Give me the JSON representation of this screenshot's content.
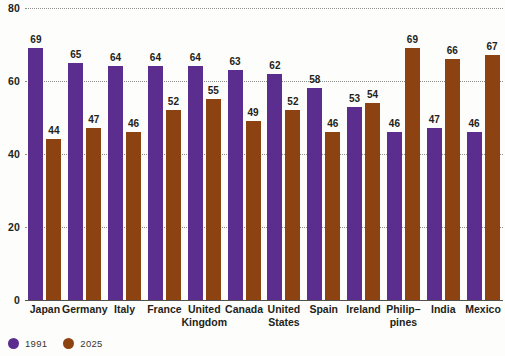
{
  "chart_data": {
    "type": "bar",
    "title": "",
    "subtitle": "",
    "xlabel": "",
    "ylabel": "",
    "ylim": [
      0,
      80
    ],
    "yticks": [
      0,
      20,
      40,
      60,
      80
    ],
    "ytick_labels": [
      "0",
      "20",
      "40",
      "60",
      "80"
    ],
    "grid": true,
    "grid_style": "dotted-horizontal",
    "legend_position": "bottom-left",
    "categories": [
      "Japan",
      "Germany",
      "Italy",
      "France",
      "United Kingdom",
      "Canada",
      "United States",
      "Spain",
      "Ireland",
      "Philip–pines",
      "India",
      "Mexico"
    ],
    "category_lines": [
      [
        "Japan",
        ""
      ],
      [
        "Germany",
        ""
      ],
      [
        "Italy",
        ""
      ],
      [
        "France",
        ""
      ],
      [
        "United",
        "Kingdom"
      ],
      [
        "Canada",
        ""
      ],
      [
        "United",
        "States"
      ],
      [
        "Spain",
        ""
      ],
      [
        "Ireland",
        ""
      ],
      [
        "Philip–",
        "pines"
      ],
      [
        "India",
        ""
      ],
      [
        "Mexico",
        ""
      ]
    ],
    "series": [
      {
        "name": "1991",
        "color": "#5b2d8e",
        "values": [
          69,
          65,
          64,
          64,
          64,
          63,
          62,
          58,
          53,
          46,
          47,
          46
        ]
      },
      {
        "name": "2025",
        "color": "#8d4212",
        "values": [
          44,
          47,
          46,
          52,
          55,
          49,
          52,
          46,
          54,
          69,
          66,
          67
        ]
      }
    ]
  },
  "legend": {
    "items": [
      {
        "label": "1991",
        "color": "#5b2d8e",
        "marker": "circle-swatch"
      },
      {
        "label": "2025",
        "color": "#8d4212",
        "marker": "circle-swatch"
      }
    ]
  },
  "colors": {
    "series_1991": "#5b2d8e",
    "series_2025": "#8d4212",
    "background": "#fdfdfb",
    "axis": "#55524d",
    "grid": "#7a7a78",
    "text": "#231f20"
  }
}
